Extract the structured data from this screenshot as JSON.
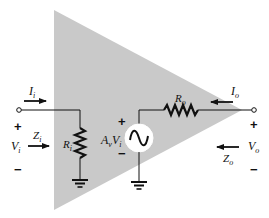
{
  "diagram": {
    "type": "amplifier-equivalent-circuit",
    "colors": {
      "amplifier_fill": "#c9c9c9",
      "stroke": "#111111",
      "background": "#ffffff",
      "source_fill": "#ffffff"
    },
    "input": {
      "current_label": "I",
      "current_sub": "i",
      "impedance_label": "Z",
      "impedance_sub": "i",
      "voltage_label": "V",
      "voltage_sub": "i",
      "plus": "+",
      "minus": "−"
    },
    "input_resistor": {
      "label": "R",
      "sub": "i"
    },
    "source": {
      "gain_label": "A",
      "gain_sub": "v",
      "voltage_label": "V",
      "voltage_sub": "i",
      "plus": "+",
      "minus": "−",
      "symbol": "~"
    },
    "output_resistor": {
      "label": "R",
      "sub": "o"
    },
    "output": {
      "current_label": "I",
      "current_sub": "o",
      "impedance_label": "Z",
      "impedance_sub": "o",
      "voltage_label": "V",
      "voltage_sub": "o",
      "plus": "+",
      "minus": "−"
    }
  }
}
